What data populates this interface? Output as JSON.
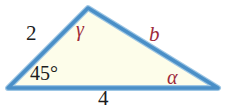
{
  "figure": {
    "type": "triangle-diagram",
    "background_color": "#ffffff",
    "fill_color": "#fdfdea",
    "stroke_color": "#4a8fc7",
    "label_color_numeric": "#1c1c1c",
    "label_color_variable": "#9e2b3a",
    "vertices": {
      "left": {
        "x": 8,
        "y": 88
      },
      "apex": {
        "x": 88,
        "y": 8
      },
      "right": {
        "x": 218,
        "y": 88
      }
    },
    "labels": {
      "side_left": "2",
      "side_bottom": "4",
      "side_right": "b",
      "angle_left": "45°",
      "angle_apex": "γ",
      "angle_right": "α"
    }
  }
}
